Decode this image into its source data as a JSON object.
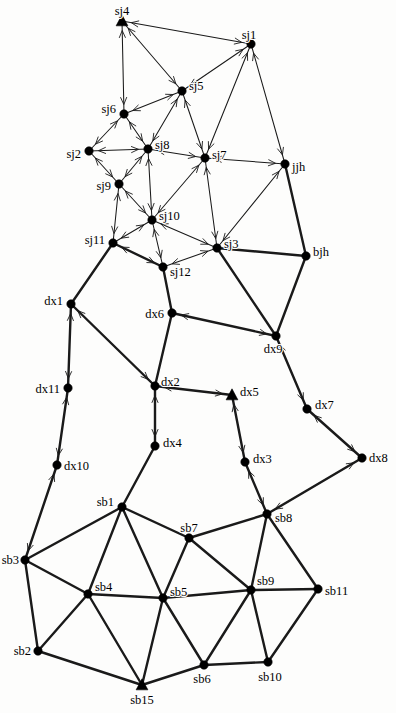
{
  "figure": {
    "type": "directed-network-graph",
    "background_color": "#fdfdfc",
    "node_color": "#000000",
    "edge_color": "#1a1a1a",
    "width": 396,
    "height": 713
  },
  "nodes": [
    {
      "id": "sj4",
      "label": "sj4",
      "x": 122,
      "y": 21,
      "marker": "triangle",
      "label_dx": 0,
      "label_dy": -9,
      "anchor": "middle"
    },
    {
      "id": "sj1",
      "label": "sj1",
      "x": 251,
      "y": 44,
      "marker": "circle",
      "label_dx": -2,
      "label_dy": -8,
      "anchor": "middle"
    },
    {
      "id": "sj5",
      "label": "sj5",
      "x": 182,
      "y": 91,
      "marker": "circle",
      "label_dx": 7,
      "label_dy": -4,
      "anchor": "start"
    },
    {
      "id": "sj6",
      "label": "sj6",
      "x": 124,
      "y": 114,
      "marker": "circle",
      "label_dx": -8,
      "label_dy": -4,
      "anchor": "end"
    },
    {
      "id": "sj2",
      "label": "sj2",
      "x": 89,
      "y": 151,
      "marker": "circle",
      "label_dx": -8,
      "label_dy": 4,
      "anchor": "end"
    },
    {
      "id": "sj8",
      "label": "sj8",
      "x": 148,
      "y": 149,
      "marker": "circle",
      "label_dx": 7,
      "label_dy": -3,
      "anchor": "start"
    },
    {
      "id": "sj7",
      "label": "sj7",
      "x": 205,
      "y": 158,
      "marker": "circle",
      "label_dx": 7,
      "label_dy": -2,
      "anchor": "start"
    },
    {
      "id": "jjh",
      "label": "jjh",
      "x": 285,
      "y": 164,
      "marker": "circle",
      "label_dx": 7,
      "label_dy": 4,
      "anchor": "start"
    },
    {
      "id": "sj9",
      "label": "sj9",
      "x": 119,
      "y": 184,
      "marker": "circle",
      "label_dx": -8,
      "label_dy": 3,
      "anchor": "end"
    },
    {
      "id": "sj10",
      "label": "sj10",
      "x": 152,
      "y": 220,
      "marker": "circle",
      "label_dx": 7,
      "label_dy": -3,
      "anchor": "start"
    },
    {
      "id": "sj3",
      "label": "sj3",
      "x": 217,
      "y": 248,
      "marker": "circle",
      "label_dx": 7,
      "label_dy": -3,
      "anchor": "start"
    },
    {
      "id": "bjh",
      "label": "bjh",
      "x": 306,
      "y": 256,
      "marker": "circle",
      "label_dx": 7,
      "label_dy": -3,
      "anchor": "start"
    },
    {
      "id": "sj11",
      "label": "sj11",
      "x": 113,
      "y": 243,
      "marker": "circle",
      "label_dx": -8,
      "label_dy": -2,
      "anchor": "end"
    },
    {
      "id": "sj12",
      "label": "sj12",
      "x": 163,
      "y": 267,
      "marker": "circle",
      "label_dx": 7,
      "label_dy": 6,
      "anchor": "start"
    },
    {
      "id": "dx1",
      "label": "dx1",
      "x": 71,
      "y": 304,
      "marker": "circle",
      "label_dx": -8,
      "label_dy": -2,
      "anchor": "end"
    },
    {
      "id": "dx6",
      "label": "dx6",
      "x": 172,
      "y": 313,
      "marker": "circle",
      "label_dx": -8,
      "label_dy": 2,
      "anchor": "end"
    },
    {
      "id": "dx9",
      "label": "dx9",
      "x": 276,
      "y": 336,
      "marker": "circle",
      "label_dx": -3,
      "label_dy": 14,
      "anchor": "middle"
    },
    {
      "id": "dx11",
      "label": "dx11",
      "x": 68,
      "y": 388,
      "marker": "circle",
      "label_dx": -8,
      "label_dy": 2,
      "anchor": "end"
    },
    {
      "id": "dx2",
      "label": "dx2",
      "x": 155,
      "y": 386,
      "marker": "circle",
      "label_dx": 6,
      "label_dy": -3,
      "anchor": "start"
    },
    {
      "id": "dx5",
      "label": "dx5",
      "x": 232,
      "y": 395,
      "marker": "triangle",
      "label_dx": 8,
      "label_dy": -2,
      "anchor": "start"
    },
    {
      "id": "dx7",
      "label": "dx7",
      "x": 307,
      "y": 409,
      "marker": "circle",
      "label_dx": 8,
      "label_dy": -3,
      "anchor": "start"
    },
    {
      "id": "dx10",
      "label": "dx10",
      "x": 57,
      "y": 465,
      "marker": "circle",
      "label_dx": 7,
      "label_dy": 2,
      "anchor": "start"
    },
    {
      "id": "dx4",
      "label": "dx4",
      "x": 155,
      "y": 446,
      "marker": "circle",
      "label_dx": 8,
      "label_dy": -2,
      "anchor": "start"
    },
    {
      "id": "dx3",
      "label": "dx3",
      "x": 245,
      "y": 462,
      "marker": "circle",
      "label_dx": 8,
      "label_dy": -2,
      "anchor": "start"
    },
    {
      "id": "dx8",
      "label": "dx8",
      "x": 362,
      "y": 458,
      "marker": "circle",
      "label_dx": 7,
      "label_dy": 1,
      "anchor": "start"
    },
    {
      "id": "sb1",
      "label": "sb1",
      "x": 122,
      "y": 507,
      "marker": "circle",
      "label_dx": -8,
      "label_dy": -4,
      "anchor": "end"
    },
    {
      "id": "sb7",
      "label": "sb7",
      "x": 189,
      "y": 538,
      "marker": "circle",
      "label_dx": 0,
      "label_dy": -9,
      "anchor": "middle"
    },
    {
      "id": "sb8",
      "label": "sb8",
      "x": 267,
      "y": 514,
      "marker": "circle",
      "label_dx": 8,
      "label_dy": 5,
      "anchor": "start"
    },
    {
      "id": "sb3",
      "label": "sb3",
      "x": 25,
      "y": 560,
      "marker": "circle",
      "label_dx": -6,
      "label_dy": 1,
      "anchor": "end"
    },
    {
      "id": "sb4",
      "label": "sb4",
      "x": 88,
      "y": 594,
      "marker": "circle",
      "label_dx": 7,
      "label_dy": -6,
      "anchor": "start"
    },
    {
      "id": "sb5",
      "label": "sb5",
      "x": 163,
      "y": 598,
      "marker": "circle",
      "label_dx": 7,
      "label_dy": -5,
      "anchor": "start"
    },
    {
      "id": "sb9",
      "label": "sb9",
      "x": 251,
      "y": 590,
      "marker": "circle",
      "label_dx": 6,
      "label_dy": -8,
      "anchor": "start"
    },
    {
      "id": "sb11",
      "label": "sb11",
      "x": 318,
      "y": 589,
      "marker": "circle",
      "label_dx": 7,
      "label_dy": 3,
      "anchor": "start"
    },
    {
      "id": "sb2",
      "label": "sb2",
      "x": 38,
      "y": 651,
      "marker": "circle",
      "label_dx": -7,
      "label_dy": 1,
      "anchor": "end"
    },
    {
      "id": "sb6",
      "label": "sb6",
      "x": 204,
      "y": 665,
      "marker": "circle",
      "label_dx": -2,
      "label_dy": 15,
      "anchor": "middle"
    },
    {
      "id": "sb10",
      "label": "sb10",
      "x": 268,
      "y": 662,
      "marker": "circle",
      "label_dx": 2,
      "label_dy": 16,
      "anchor": "middle"
    },
    {
      "id": "sb15",
      "label": "sb15",
      "x": 142,
      "y": 685,
      "marker": "triangle",
      "label_dx": 0,
      "label_dy": 16,
      "anchor": "middle"
    }
  ],
  "edges": [
    {
      "from": "sj4",
      "to": "sj1",
      "weight": 1,
      "arrows": "both"
    },
    {
      "from": "sj4",
      "to": "sj6",
      "weight": 1,
      "arrows": "both"
    },
    {
      "from": "sj4",
      "to": "sj5",
      "weight": 1,
      "arrows": "both"
    },
    {
      "from": "sj1",
      "to": "sj5",
      "weight": 1,
      "arrows": "both"
    },
    {
      "from": "sj1",
      "to": "sj7",
      "weight": 1,
      "arrows": "both"
    },
    {
      "from": "sj1",
      "to": "jjh",
      "weight": 1,
      "arrows": "both"
    },
    {
      "from": "sj5",
      "to": "sj6",
      "weight": 1,
      "arrows": "both"
    },
    {
      "from": "sj5",
      "to": "sj8",
      "weight": 1,
      "arrows": "both"
    },
    {
      "from": "sj5",
      "to": "sj7",
      "weight": 1,
      "arrows": "both"
    },
    {
      "from": "sj6",
      "to": "sj2",
      "weight": 1,
      "arrows": "both"
    },
    {
      "from": "sj6",
      "to": "sj8",
      "weight": 1,
      "arrows": "both"
    },
    {
      "from": "sj2",
      "to": "sj8",
      "weight": 1,
      "arrows": "both"
    },
    {
      "from": "sj2",
      "to": "sj9",
      "weight": 1,
      "arrows": "both"
    },
    {
      "from": "sj8",
      "to": "sj7",
      "weight": 1,
      "arrows": "both"
    },
    {
      "from": "sj8",
      "to": "sj9",
      "weight": 1,
      "arrows": "both"
    },
    {
      "from": "sj8",
      "to": "sj10",
      "weight": 1,
      "arrows": "both"
    },
    {
      "from": "sj7",
      "to": "jjh",
      "weight": 1,
      "arrows": "both"
    },
    {
      "from": "sj7",
      "to": "sj10",
      "weight": 1,
      "arrows": "both"
    },
    {
      "from": "sj7",
      "to": "sj3",
      "weight": 1,
      "arrows": "both"
    },
    {
      "from": "jjh",
      "to": "sj3",
      "weight": 1,
      "arrows": "both"
    },
    {
      "from": "jjh",
      "to": "bjh",
      "weight": 2,
      "arrows": "none"
    },
    {
      "from": "sj9",
      "to": "sj10",
      "weight": 1,
      "arrows": "both"
    },
    {
      "from": "sj9",
      "to": "sj11",
      "weight": 1,
      "arrows": "both"
    },
    {
      "from": "sj10",
      "to": "sj11",
      "weight": 1,
      "arrows": "both"
    },
    {
      "from": "sj10",
      "to": "sj12",
      "weight": 1,
      "arrows": "both"
    },
    {
      "from": "sj10",
      "to": "sj3",
      "weight": 1,
      "arrows": "both"
    },
    {
      "from": "sj3",
      "to": "sj12",
      "weight": 1,
      "arrows": "both"
    },
    {
      "from": "sj3",
      "to": "bjh",
      "weight": 2,
      "arrows": "none"
    },
    {
      "from": "sj3",
      "to": "dx9",
      "weight": 2,
      "arrows": "none"
    },
    {
      "from": "sj11",
      "to": "sj12",
      "weight": 2,
      "arrows": "both"
    },
    {
      "from": "sj11",
      "to": "dx1",
      "weight": 2,
      "arrows": "none"
    },
    {
      "from": "sj12",
      "to": "dx6",
      "weight": 2,
      "arrows": "none"
    },
    {
      "from": "bjh",
      "to": "dx9",
      "weight": 2,
      "arrows": "none"
    },
    {
      "from": "dx1",
      "to": "dx11",
      "weight": 2,
      "arrows": "both"
    },
    {
      "from": "dx1",
      "to": "dx2",
      "weight": 2,
      "arrows": "both"
    },
    {
      "from": "dx6",
      "to": "dx9",
      "weight": 2,
      "arrows": "both"
    },
    {
      "from": "dx6",
      "to": "dx2",
      "weight": 2,
      "arrows": "none"
    },
    {
      "from": "dx9",
      "to": "dx7",
      "weight": 2,
      "arrows": "both"
    },
    {
      "from": "dx11",
      "to": "dx10",
      "weight": 2,
      "arrows": "both"
    },
    {
      "from": "dx2",
      "to": "dx5",
      "weight": 2,
      "arrows": "both"
    },
    {
      "from": "dx2",
      "to": "dx4",
      "weight": 2,
      "arrows": "both"
    },
    {
      "from": "dx5",
      "to": "dx3",
      "weight": 2,
      "arrows": "both"
    },
    {
      "from": "dx7",
      "to": "dx8",
      "weight": 2,
      "arrows": "both"
    },
    {
      "from": "dx10",
      "to": "sb3",
      "weight": 2,
      "arrows": "both"
    },
    {
      "from": "dx4",
      "to": "sb1",
      "weight": 2,
      "arrows": "none"
    },
    {
      "from": "dx3",
      "to": "sb8",
      "weight": 2,
      "arrows": "both"
    },
    {
      "from": "dx8",
      "to": "sb8",
      "weight": 2,
      "arrows": "both"
    },
    {
      "from": "sb1",
      "to": "sb7",
      "weight": 2,
      "arrows": "none"
    },
    {
      "from": "sb1",
      "to": "sb3",
      "weight": 2,
      "arrows": "none"
    },
    {
      "from": "sb1",
      "to": "sb4",
      "weight": 2,
      "arrows": "none"
    },
    {
      "from": "sb1",
      "to": "sb5",
      "weight": 2,
      "arrows": "none"
    },
    {
      "from": "sb7",
      "to": "sb8",
      "weight": 2,
      "arrows": "none"
    },
    {
      "from": "sb7",
      "to": "sb5",
      "weight": 2,
      "arrows": "none"
    },
    {
      "from": "sb7",
      "to": "sb9",
      "weight": 2,
      "arrows": "none"
    },
    {
      "from": "sb8",
      "to": "sb9",
      "weight": 2,
      "arrows": "none"
    },
    {
      "from": "sb8",
      "to": "sb11",
      "weight": 2,
      "arrows": "none"
    },
    {
      "from": "sb3",
      "to": "sb4",
      "weight": 2,
      "arrows": "none"
    },
    {
      "from": "sb3",
      "to": "sb2",
      "weight": 2,
      "arrows": "none"
    },
    {
      "from": "sb4",
      "to": "sb5",
      "weight": 2,
      "arrows": "none"
    },
    {
      "from": "sb4",
      "to": "sb2",
      "weight": 2,
      "arrows": "none"
    },
    {
      "from": "sb4",
      "to": "sb15",
      "weight": 2,
      "arrows": "none"
    },
    {
      "from": "sb5",
      "to": "sb9",
      "weight": 2,
      "arrows": "none"
    },
    {
      "from": "sb5",
      "to": "sb15",
      "weight": 2,
      "arrows": "none"
    },
    {
      "from": "sb5",
      "to": "sb6",
      "weight": 2,
      "arrows": "none"
    },
    {
      "from": "sb9",
      "to": "sb11",
      "weight": 2,
      "arrows": "none"
    },
    {
      "from": "sb9",
      "to": "sb6",
      "weight": 2,
      "arrows": "none"
    },
    {
      "from": "sb9",
      "to": "sb10",
      "weight": 2,
      "arrows": "none"
    },
    {
      "from": "sb11",
      "to": "sb10",
      "weight": 2,
      "arrows": "none"
    },
    {
      "from": "sb2",
      "to": "sb15",
      "weight": 2,
      "arrows": "none"
    },
    {
      "from": "sb6",
      "to": "sb15",
      "weight": 2,
      "arrows": "none"
    },
    {
      "from": "sb6",
      "to": "sb10",
      "weight": 2,
      "arrows": "none"
    }
  ]
}
